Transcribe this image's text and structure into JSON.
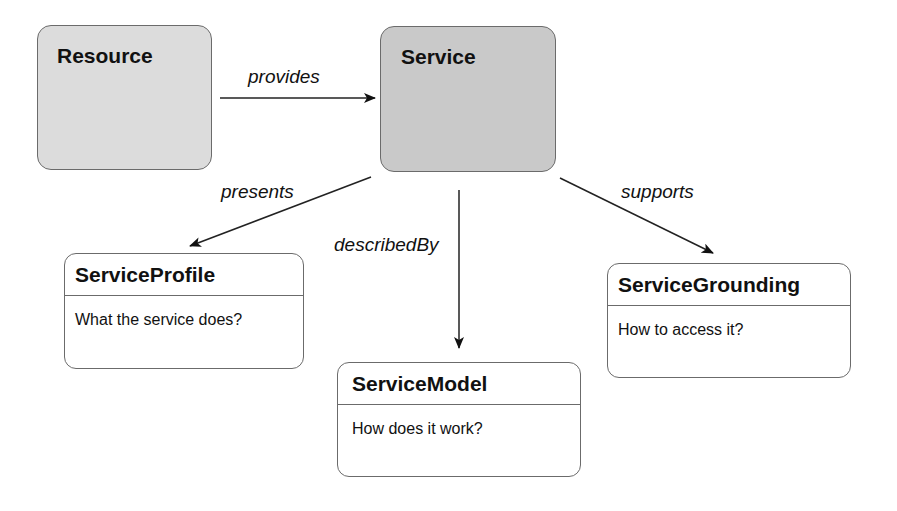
{
  "nodes": {
    "resource": {
      "title": "Resource"
    },
    "service": {
      "title": "Service"
    },
    "service_profile": {
      "title": "ServiceProfile",
      "description": "What the service does?"
    },
    "service_model": {
      "title": "ServiceModel",
      "description": "How does it work?"
    },
    "service_grounding": {
      "title": "ServiceGrounding",
      "description": "How to access it?"
    }
  },
  "edges": {
    "provides": {
      "label": "provides",
      "from": "Resource",
      "to": "Service"
    },
    "presents": {
      "label": "presents",
      "from": "Service",
      "to": "ServiceProfile"
    },
    "described_by": {
      "label": "describedBy",
      "from": "Service",
      "to": "ServiceModel"
    },
    "supports": {
      "label": "supports",
      "from": "Service",
      "to": "ServiceGrounding"
    }
  }
}
